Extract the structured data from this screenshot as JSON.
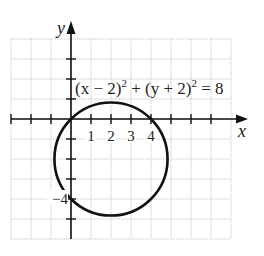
{
  "diagram": {
    "type": "coordinate-plane-circle",
    "axes": {
      "x_label": "x",
      "y_label": "y",
      "x_range": [
        -3,
        8
      ],
      "y_range": [
        -6,
        4
      ],
      "grid_step": 1
    },
    "x_tick_labels": [
      {
        "value": 1,
        "text": "1"
      },
      {
        "value": 2,
        "text": "2"
      },
      {
        "value": 3,
        "text": "3"
      },
      {
        "value": 4,
        "text": "4"
      }
    ],
    "y_tick_labels": [
      {
        "value": -4,
        "text": "−4"
      }
    ],
    "equation": {
      "part1": "(x − 2)",
      "exp1": "2",
      "part2": " + (y + 2)",
      "exp2": "2",
      "part3": " = 8"
    },
    "circle": {
      "center": [
        2,
        -2
      ],
      "radius_squared": 8,
      "color": "#111111"
    },
    "colors": {
      "grid": "#b9b9b9",
      "axis": "#111111",
      "background": "#ffffff"
    }
  }
}
